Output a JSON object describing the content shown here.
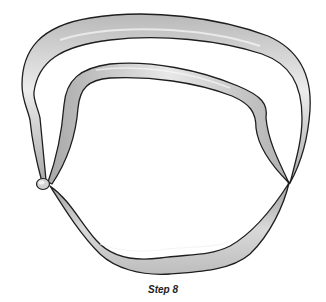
{
  "figure": {
    "colors": {
      "balloon_fill_light": "#e6e6e6",
      "balloon_fill_dark": "#a8a8a8",
      "outline": "#1e1e1e",
      "background": "#ffffff"
    }
  },
  "caption": {
    "text": "Step 8"
  }
}
